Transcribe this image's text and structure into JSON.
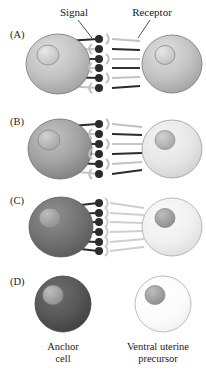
{
  "figure": {
    "title_labels": {
      "signal": "Signal",
      "receptor": "Receptor"
    },
    "bottom_labels": {
      "left_line1": "Anchor",
      "left_line2": "cell",
      "right_line1": "Ventral uterine",
      "right_line2": "precursor"
    },
    "panels": [
      {
        "letter": "(A)",
        "left_cell_fill": "#b9b9b9",
        "left_cell_nucleus": "#cfcfcf",
        "right_cell_fill": "#bdbdbd",
        "right_cell_nucleus": "#d2d2d2",
        "connectors": [
          {
            "dot": "dark",
            "receptor": "light",
            "signal_from": "left"
          },
          {
            "dot": "dark",
            "receptor": "light",
            "signal_from": "right"
          },
          {
            "dot": "dark",
            "receptor": "light",
            "signal_from": "left"
          },
          {
            "dot": "dark",
            "receptor": "light",
            "signal_from": "right"
          },
          {
            "dot": "dark",
            "receptor": "light",
            "signal_from": "left"
          },
          {
            "dot": "dark",
            "receptor": "light",
            "signal_from": "right"
          }
        ]
      },
      {
        "letter": "(B)",
        "left_cell_fill": "#9a9a9a",
        "left_cell_nucleus": "#b5b5b5",
        "right_cell_fill": "#e3e3e3",
        "right_cell_nucleus": "#b8b8b8",
        "connectors": [
          {
            "dot": "dark",
            "receptor": "light",
            "signal_from": "left"
          },
          {
            "dot": "dark",
            "receptor": "light",
            "signal_from": "right"
          },
          {
            "dot": "dark",
            "receptor": "light",
            "signal_from": "left"
          },
          {
            "dot": "dark",
            "receptor": "light",
            "signal_from": "right"
          },
          {
            "dot": "dark",
            "receptor": "light",
            "signal_from": "left"
          },
          {
            "dot": "dark",
            "receptor": "light",
            "signal_from": "right"
          }
        ]
      },
      {
        "letter": "(C)",
        "left_cell_fill": "#6f6f6f",
        "left_cell_nucleus": "#9e9e9e",
        "right_cell_fill": "#efefef",
        "right_cell_nucleus": "#b0b0b0",
        "connectors": [
          {
            "dot": "dark",
            "receptor": "light",
            "signal_from": "left"
          },
          {
            "dot": "dark",
            "receptor": "light",
            "signal_from": "left"
          },
          {
            "dot": "dark",
            "receptor": "light",
            "signal_from": "left"
          },
          {
            "dot": "dark",
            "receptor": "light",
            "signal_from": "left"
          },
          {
            "dot": "dark",
            "receptor": "light",
            "signal_from": "left"
          },
          {
            "dot": "dark",
            "receptor": "light",
            "signal_from": "left"
          }
        ]
      },
      {
        "letter": "(D)",
        "left_cell_fill": "#555555",
        "left_cell_nucleus": "#8d8d8d",
        "right_cell_fill": "#fbfbfb",
        "right_cell_nucleus": "#a8a8a8",
        "connectors": []
      }
    ],
    "colors": {
      "signal_dot": "#2b2b2b",
      "receptor": "#c8c8c8",
      "line_dark": "#2b2b2b",
      "line_light": "#c2c2c2",
      "outline": "#6b6b6b",
      "background": "#ffffff"
    }
  }
}
